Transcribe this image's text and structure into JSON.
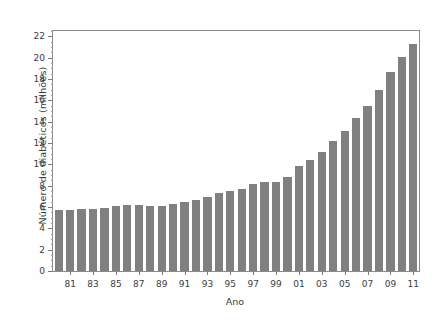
{
  "chart_data": {
    "type": "bar",
    "title": "",
    "xlabel": "Ano",
    "ylabel": "Número de diabéticos (milhões)",
    "categories": [
      "80",
      "81",
      "82",
      "83",
      "84",
      "85",
      "86",
      "87",
      "88",
      "89",
      "90",
      "91",
      "92",
      "93",
      "94",
      "95",
      "96",
      "97",
      "98",
      "99",
      "00",
      "01",
      "02",
      "03",
      "04",
      "05",
      "06",
      "07",
      "08",
      "09",
      "10",
      "11"
    ],
    "tick_labels": [
      "81",
      "83",
      "85",
      "87",
      "89",
      "91",
      "93",
      "95",
      "97",
      "99",
      "01",
      "03",
      "05",
      "07",
      "09",
      "11"
    ],
    "values": [
      5.7,
      5.7,
      5.8,
      5.8,
      5.9,
      6.1,
      6.2,
      6.2,
      6.1,
      6.1,
      6.3,
      6.5,
      6.7,
      6.9,
      7.3,
      7.5,
      7.7,
      8.2,
      8.3,
      8.3,
      8.8,
      9.8,
      10.4,
      11.2,
      12.2,
      13.1,
      14.3,
      15.5,
      17.0,
      18.7,
      20.1,
      21.3
    ],
    "ylim": [
      0,
      22.5
    ],
    "yticks": [
      0,
      2,
      4,
      6,
      8,
      10,
      12,
      14,
      16,
      18,
      20,
      22
    ],
    "ytick_labels": [
      "0",
      "2",
      "4",
      "6",
      "8",
      "10",
      "12",
      "14",
      "16",
      "18",
      "20",
      "22"
    ],
    "grid": false,
    "legend": null,
    "bar_color": "#808080",
    "axis_color": "#8c8c8c",
    "background": "#ffffff"
  }
}
